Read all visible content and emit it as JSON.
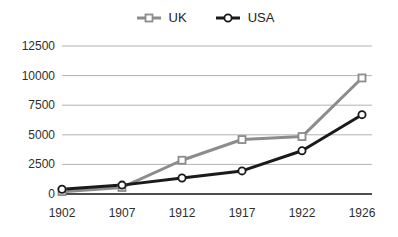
{
  "chart_data": {
    "type": "line",
    "title": "",
    "xlabel": "",
    "ylabel": "",
    "categories": [
      "1902",
      "1907",
      "1912",
      "1917",
      "1922",
      "1926"
    ],
    "series": [
      {
        "name": "UK",
        "marker": "square",
        "color": "#8c8c8c",
        "values": [
          200,
          550,
          2850,
          4600,
          4850,
          9800
        ]
      },
      {
        "name": "USA",
        "marker": "circle",
        "color": "#1a1a1a",
        "values": [
          400,
          750,
          1350,
          1950,
          3650,
          6700
        ]
      }
    ],
    "ylim": [
      0,
      12500
    ],
    "ytick_step": 2500,
    "ytick_labels": [
      "0",
      "2500",
      "5000",
      "7500",
      "10000",
      "12500"
    ],
    "grid": "horizontal",
    "legend_position": "top",
    "gridline_color": "#b3b3b3",
    "axis_color": "#4d4d4d",
    "tick_label_color": "#2e2e2e"
  }
}
